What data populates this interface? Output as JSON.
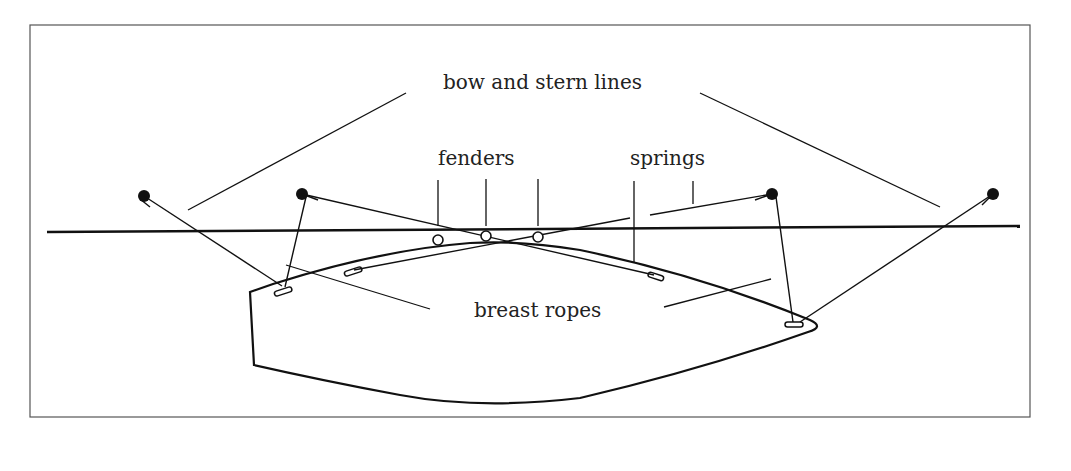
{
  "diagram": {
    "labels": {
      "bow_and_stern_lines": "bow and stern lines",
      "fenders": "fenders",
      "springs": "springs",
      "breast_ropes": "breast ropes"
    },
    "colors": {
      "line": "#111111",
      "frame": "#555555",
      "background": "#ffffff",
      "text": "#222222"
    },
    "elements": {
      "quay_edge": "horizontal line representing quay/dock edge",
      "bollards": [
        "far-left bollard",
        "left bollard",
        "right bollard",
        "far-right bollard"
      ],
      "fenders_count": 3,
      "cleats_count": 4,
      "hull": "boat hull, bow pointing right"
    }
  }
}
